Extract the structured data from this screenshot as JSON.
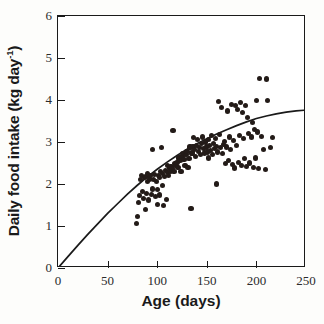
{
  "chart_data": {
    "type": "scatter",
    "title": "",
    "xlabel": "Age (days)",
    "ylabel": "Daily food intake (kg day⁻¹)",
    "ylabel_main": "Daily food intake (kg day",
    "ylabel_sup": "-1",
    "ylabel_tail": ")",
    "xlim": [
      0,
      250
    ],
    "ylim": [
      0,
      6
    ],
    "xticks": [
      0,
      50,
      100,
      150,
      200,
      250
    ],
    "yticks": [
      0,
      1,
      2,
      3,
      4,
      5,
      6
    ],
    "xtick_labels": [
      "0",
      "50",
      "100",
      "150",
      "200",
      "250"
    ],
    "ytick_labels": [
      "0",
      "1",
      "2",
      "3",
      "4",
      "5",
      "6"
    ],
    "grid": false,
    "legend": "none",
    "marker_color": "#231b18",
    "marker_size_px": 5.2,
    "axis_color": "#1a1a1a",
    "background": "#ffffff",
    "series": [
      {
        "name": "Daily food intake observations",
        "marker": "filled-circle",
        "points": [
          [
            79,
            1.05
          ],
          [
            80,
            1.22
          ],
          [
            81,
            1.55
          ],
          [
            82,
            1.72
          ],
          [
            83,
            2.1
          ],
          [
            84,
            2.2
          ],
          [
            85,
            1.82
          ],
          [
            86,
            1.66
          ],
          [
            87,
            2.15
          ],
          [
            88,
            2.18
          ],
          [
            88,
            1.4
          ],
          [
            89,
            1.78
          ],
          [
            90,
            2.05
          ],
          [
            90,
            2.25
          ],
          [
            91,
            1.62
          ],
          [
            92,
            2.12
          ],
          [
            93,
            2.2
          ],
          [
            94,
            1.75
          ],
          [
            95,
            1.88
          ],
          [
            95,
            2.82
          ],
          [
            96,
            2.1
          ],
          [
            97,
            2.22
          ],
          [
            98,
            1.7
          ],
          [
            99,
            2.05
          ],
          [
            100,
            1.52
          ],
          [
            100,
            1.86
          ],
          [
            101,
            2.2
          ],
          [
            102,
            2.16
          ],
          [
            102,
            1.74
          ],
          [
            103,
            2.3
          ],
          [
            104,
            2.86
          ],
          [
            105,
            1.96
          ],
          [
            105,
            2.25
          ],
          [
            106,
            1.48
          ],
          [
            107,
            2.18
          ],
          [
            108,
            2.32
          ],
          [
            109,
            1.64
          ],
          [
            110,
            2.28
          ],
          [
            110,
            2.45
          ],
          [
            111,
            2.2
          ],
          [
            112,
            2.38
          ],
          [
            113,
            2.3
          ],
          [
            114,
            2.42
          ],
          [
            115,
            2.36
          ],
          [
            116,
            3.28
          ],
          [
            117,
            2.3
          ],
          [
            118,
            2.48
          ],
          [
            119,
            2.44
          ],
          [
            120,
            2.52
          ],
          [
            121,
            2.4
          ],
          [
            122,
            2.62
          ],
          [
            123,
            2.56
          ],
          [
            124,
            2.3
          ],
          [
            125,
            2.66
          ],
          [
            126,
            2.72
          ],
          [
            127,
            2.58
          ],
          [
            128,
            2.44
          ],
          [
            129,
            2.7
          ],
          [
            130,
            2.78
          ],
          [
            131,
            2.4
          ],
          [
            132,
            2.6
          ],
          [
            133,
            2.88
          ],
          [
            134,
            1.42
          ],
          [
            135,
            2.74
          ],
          [
            136,
            2.9
          ],
          [
            137,
            3.1
          ],
          [
            138,
            2.82
          ],
          [
            139,
            2.66
          ],
          [
            140,
            2.92
          ],
          [
            141,
            3.05
          ],
          [
            142,
            2.78
          ],
          [
            143,
            2.86
          ],
          [
            144,
            2.7
          ],
          [
            145,
            2.96
          ],
          [
            146,
            3.12
          ],
          [
            147,
            2.84
          ],
          [
            148,
            2.74
          ],
          [
            149,
            3.0
          ],
          [
            150,
            2.88
          ],
          [
            151,
            2.76
          ],
          [
            152,
            3.06
          ],
          [
            152,
            2.62
          ],
          [
            153,
            2.92
          ],
          [
            154,
            2.8
          ],
          [
            155,
            3.16
          ],
          [
            156,
            2.7
          ],
          [
            157,
            2.96
          ],
          [
            158,
            2.84
          ],
          [
            159,
            3.08
          ],
          [
            160,
            2.0
          ],
          [
            160,
            2.9
          ],
          [
            161,
            2.76
          ],
          [
            162,
            3.96
          ],
          [
            163,
            3.18
          ],
          [
            164,
            2.86
          ],
          [
            165,
            3.82
          ],
          [
            166,
            2.72
          ],
          [
            167,
            2.94
          ],
          [
            168,
            3.02
          ],
          [
            169,
            2.48
          ],
          [
            170,
            2.88
          ],
          [
            171,
            3.74
          ],
          [
            172,
            2.56
          ],
          [
            173,
            3.12
          ],
          [
            174,
            2.82
          ],
          [
            175,
            3.9
          ],
          [
            176,
            2.46
          ],
          [
            177,
            3.04
          ],
          [
            178,
            2.38
          ],
          [
            179,
            3.86
          ],
          [
            180,
            2.92
          ],
          [
            181,
            3.78
          ],
          [
            182,
            2.52
          ],
          [
            183,
            3.16
          ],
          [
            184,
            3.94
          ],
          [
            185,
            2.44
          ],
          [
            186,
            3.7
          ],
          [
            187,
            3.08
          ],
          [
            188,
            2.6
          ],
          [
            189,
            3.86
          ],
          [
            190,
            2.42
          ],
          [
            191,
            3.58
          ],
          [
            192,
            3.2
          ],
          [
            193,
            2.5
          ],
          [
            195,
            3.12
          ],
          [
            196,
            3.46
          ],
          [
            197,
            2.4
          ],
          [
            198,
            3.3
          ],
          [
            199,
            2.62
          ],
          [
            200,
            3.98
          ],
          [
            201,
            3.24
          ],
          [
            202,
            2.36
          ],
          [
            203,
            4.52
          ],
          [
            205,
            3.14
          ],
          [
            207,
            2.82
          ],
          [
            209,
            2.34
          ],
          [
            210,
            4.5
          ],
          [
            211,
            3.98
          ],
          [
            214,
            2.86
          ],
          [
            216,
            3.1
          ]
        ]
      }
    ],
    "fit_curve": {
      "name": "fitted growth curve",
      "color": "#1a1a1a",
      "points": [
        [
          0,
          0.0
        ],
        [
          10,
          0.27
        ],
        [
          20,
          0.54
        ],
        [
          30,
          0.8
        ],
        [
          40,
          1.05
        ],
        [
          50,
          1.3
        ],
        [
          60,
          1.53
        ],
        [
          70,
          1.76
        ],
        [
          80,
          1.97
        ],
        [
          90,
          2.17
        ],
        [
          100,
          2.35
        ],
        [
          110,
          2.52
        ],
        [
          120,
          2.68
        ],
        [
          130,
          2.83
        ],
        [
          140,
          2.96
        ],
        [
          150,
          3.08
        ],
        [
          160,
          3.19
        ],
        [
          170,
          3.29
        ],
        [
          180,
          3.39
        ],
        [
          190,
          3.48
        ],
        [
          200,
          3.56
        ],
        [
          210,
          3.62
        ],
        [
          220,
          3.67
        ],
        [
          230,
          3.71
        ],
        [
          240,
          3.74
        ],
        [
          250,
          3.76
        ]
      ]
    }
  }
}
